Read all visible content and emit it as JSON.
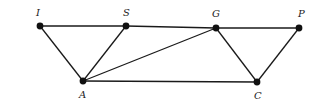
{
  "diagram": {
    "type": "graph",
    "nodes": [
      {
        "id": "I",
        "label": "I",
        "x": 40,
        "y": 26,
        "lx": 36,
        "ly": 16
      },
      {
        "id": "S",
        "label": "S",
        "x": 126,
        "y": 26,
        "lx": 123,
        "ly": 16
      },
      {
        "id": "G",
        "label": "G",
        "x": 216,
        "y": 28,
        "lx": 212,
        "ly": 17
      },
      {
        "id": "P",
        "label": "P",
        "x": 299,
        "y": 28,
        "lx": 298,
        "ly": 17
      },
      {
        "id": "A",
        "label": "A",
        "x": 83,
        "y": 81,
        "lx": 79,
        "ly": 98
      },
      {
        "id": "C",
        "label": "C",
        "x": 257,
        "y": 82,
        "lx": 254,
        "ly": 99
      }
    ],
    "edges": [
      [
        "I",
        "S"
      ],
      [
        "S",
        "G"
      ],
      [
        "G",
        "P"
      ],
      [
        "I",
        "A"
      ],
      [
        "S",
        "A"
      ],
      [
        "G",
        "A"
      ],
      [
        "A",
        "C"
      ],
      [
        "G",
        "C"
      ],
      [
        "P",
        "C"
      ]
    ]
  }
}
